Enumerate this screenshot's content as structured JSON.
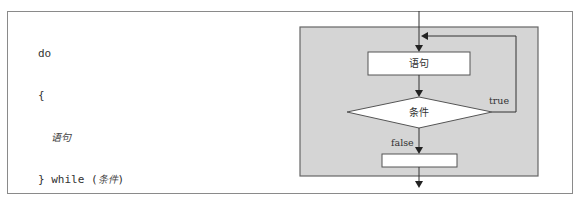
{
  "code": {
    "line1": "do",
    "line2": "{",
    "line3_statement": "语句",
    "line4_prefix": "} while (",
    "line4_condition": "条件",
    "line4_suffix": ")"
  },
  "flowchart": {
    "statement_label": "语句",
    "condition_label": "条件",
    "true_label": "true",
    "false_label": "false"
  },
  "colors": {
    "panel_fill": "#d5d5d5",
    "panel_stroke": "#666666",
    "frame_stroke": "#8a8a8a",
    "line": "#333333"
  }
}
